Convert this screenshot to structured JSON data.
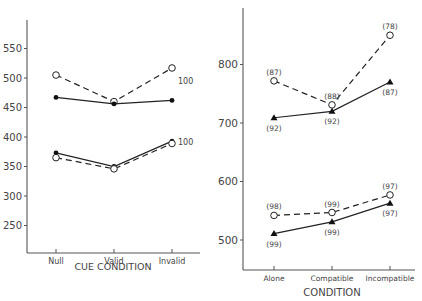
{
  "chart_data": [
    {
      "type": "line",
      "title": "",
      "xlabel": "CUE CONDITION",
      "ylabel": "",
      "categories": [
        "Null",
        "Valid",
        "Invalid"
      ],
      "yticks": [
        250,
        300,
        350,
        400,
        450,
        500,
        550
      ],
      "ylim": [
        200,
        600
      ],
      "grid": false,
      "series": [
        {
          "name": "upper-dashed-open",
          "style": "dashed",
          "marker": "open-circle",
          "values": [
            505,
            460,
            517
          ],
          "label": "100"
        },
        {
          "name": "upper-solid-filled",
          "style": "solid",
          "marker": "filled-circle",
          "values": [
            467,
            456,
            462
          ]
        },
        {
          "name": "lower-solid-filled",
          "style": "solid",
          "marker": "filled-circle",
          "values": [
            373,
            350,
            393
          ]
        },
        {
          "name": "lower-dashed-open",
          "style": "dashed",
          "marker": "open-circle",
          "values": [
            365,
            346,
            389
          ],
          "label": "100"
        }
      ]
    },
    {
      "type": "line",
      "title": "",
      "xlabel": "CONDITION",
      "ylabel": "",
      "categories": [
        "Alone",
        "Compatible",
        "Incompatible"
      ],
      "yticks": [
        500,
        600,
        700,
        800
      ],
      "ylim": [
        450,
        900
      ],
      "grid": false,
      "series": [
        {
          "name": "upper-dashed-open",
          "style": "dashed",
          "marker": "open-circle",
          "values": [
            772,
            731,
            850
          ],
          "annotations": [
            "(87)",
            "(88)",
            "(78)"
          ]
        },
        {
          "name": "upper-solid-triangle",
          "style": "solid",
          "marker": "filled-triangle",
          "values": [
            709,
            720,
            770
          ],
          "annotations": [
            "(92)",
            "(92)",
            "(87)"
          ]
        },
        {
          "name": "lower-dashed-open",
          "style": "dashed",
          "marker": "open-circle",
          "values": [
            542,
            547,
            577
          ],
          "annotations": [
            "(98)",
            "(99)",
            "(97)"
          ]
        },
        {
          "name": "lower-solid-triangle",
          "style": "solid",
          "marker": "filled-triangle",
          "values": [
            511,
            531,
            563
          ],
          "annotations": [
            "(99)",
            "(99)",
            "(97)"
          ]
        }
      ]
    }
  ]
}
